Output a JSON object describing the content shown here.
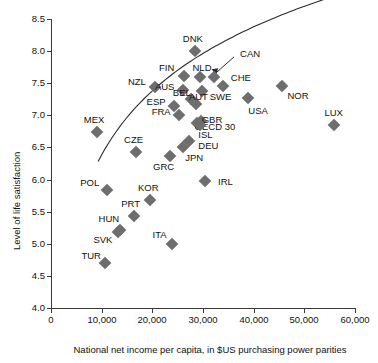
{
  "chart_data": {
    "type": "scatter",
    "title": "",
    "xlabel": "National net income per capita, in $US purchasing power parities",
    "ylabel": "Level of life satisfaction",
    "xlim": [
      0,
      60000
    ],
    "ylim": [
      4.0,
      8.5
    ],
    "xticks": [
      0,
      10000,
      20000,
      30000,
      40000,
      50000,
      60000
    ],
    "xtick_labels": [
      "0",
      "10,000",
      "20,000",
      "30,000",
      "40,000",
      "50,000",
      "60,000"
    ],
    "yticks": [
      4.0,
      4.5,
      5.0,
      5.5,
      6.0,
      6.5,
      7.0,
      7.5,
      8.0,
      8.5
    ],
    "ytick_labels": [
      "4.0",
      "4.5",
      "5.0",
      "5.5",
      "6.0",
      "6.5",
      "7.0",
      "7.5",
      "8.0",
      "8.5"
    ],
    "grid": false,
    "legend": "none",
    "marker": "diamond",
    "marker_color": "#6e6e6e",
    "trendline": {
      "present": true,
      "color": "#2b2b2b",
      "description": "logarithmic fit rising from about 5.35 at $10,000 to about 7.8 at $60,000"
    },
    "points": [
      {
        "label": "DNK",
        "x": 28400,
        "y": 8.0,
        "lx": -2,
        "ly": -12
      },
      {
        "label": "FIN",
        "x": 26200,
        "y": 7.61,
        "lx": -17,
        "ly": -8
      },
      {
        "label": "NLD",
        "x": 29400,
        "y": 7.59,
        "lx": 2,
        "ly": -9
      },
      {
        "label": "CAN",
        "x": 32200,
        "y": 7.6,
        "lx": 36,
        "ly": -23
      },
      {
        "label": "CHE",
        "x": 33900,
        "y": 7.45,
        "lx": 18,
        "ly": -8
      },
      {
        "label": "NZL",
        "x": 20500,
        "y": 7.44,
        "lx": -18,
        "ly": -5
      },
      {
        "label": "AUS",
        "x": 26000,
        "y": 7.4,
        "lx": -18,
        "ly": -3
      },
      {
        "label": "SWE",
        "x": 29700,
        "y": 7.38,
        "lx": 19,
        "ly": 6
      },
      {
        "label": "NOR",
        "x": 45600,
        "y": 7.45,
        "lx": 16,
        "ly": 10
      },
      {
        "label": "BEL",
        "x": 27600,
        "y": 7.26,
        "lx": -9,
        "ly": -6
      },
      {
        "label": "USA",
        "x": 38900,
        "y": 7.27,
        "lx": 10,
        "ly": 13
      },
      {
        "label": "ESP",
        "x": 24300,
        "y": 7.14,
        "lx": -18,
        "ly": -4
      },
      {
        "label": "AUT",
        "x": 28700,
        "y": 7.17,
        "lx": 2,
        "ly": -7
      },
      {
        "label": "FRA",
        "x": 25300,
        "y": 7.0,
        "lx": -18,
        "ly": -3
      },
      {
        "label": "GBR",
        "x": 29600,
        "y": 6.91,
        "lx": 11,
        "ly": -1
      },
      {
        "label": "OECD 30",
        "x": 28800,
        "y": 6.88,
        "lx": 18,
        "ly": 4
      },
      {
        "label": "ISL",
        "x": 29300,
        "y": 6.85,
        "lx": 6,
        "ly": 10
      },
      {
        "label": "LUX",
        "x": 55800,
        "y": 6.85,
        "lx": 0,
        "ly": -12
      },
      {
        "label": "MEX",
        "x": 9100,
        "y": 6.74,
        "lx": -3,
        "ly": -12
      },
      {
        "label": "DEU",
        "x": 27300,
        "y": 6.6,
        "lx": 19,
        "ly": 5
      },
      {
        "label": "JPN",
        "x": 26100,
        "y": 6.51,
        "lx": 11,
        "ly": 11
      },
      {
        "label": "CZE",
        "x": 16700,
        "y": 6.43,
        "lx": -2,
        "ly": -12
      },
      {
        "label": "GRC",
        "x": 23400,
        "y": 6.36,
        "lx": -6,
        "ly": 11
      },
      {
        "label": "IRL",
        "x": 30300,
        "y": 5.98,
        "lx": 21,
        "ly": 1
      },
      {
        "label": "POL",
        "x": 11000,
        "y": 5.84,
        "lx": -17,
        "ly": -7
      },
      {
        "label": "KOR",
        "x": 19600,
        "y": 5.68,
        "lx": -2,
        "ly": -12
      },
      {
        "label": "PRT",
        "x": 16300,
        "y": 5.43,
        "lx": -3,
        "ly": -12
      },
      {
        "label": "HUN",
        "x": 13600,
        "y": 5.22,
        "lx": -11,
        "ly": -11
      },
      {
        "label": "SVK",
        "x": 13200,
        "y": 5.18,
        "lx": -15,
        "ly": 8
      },
      {
        "label": "ITA",
        "x": 23800,
        "y": 4.99,
        "lx": -12,
        "ly": -9
      },
      {
        "label": "TUR",
        "x": 10700,
        "y": 4.7,
        "lx": -14,
        "ly": -7
      }
    ]
  }
}
